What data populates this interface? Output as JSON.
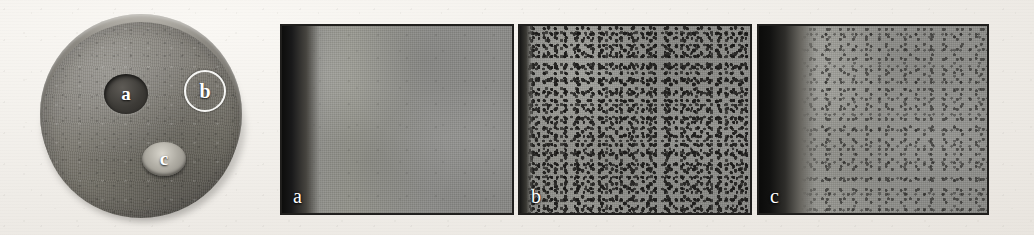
{
  "figure": {
    "background_color": "#efece7",
    "ghost_text": {
      "left": "",
      "right": "",
      "bottom": ""
    }
  },
  "specimen": {
    "name": "cylindrical-metal-specimen-disc",
    "body_color": "#807d76",
    "rim_color": "#8e8b84",
    "sites": [
      {
        "id": "a",
        "label": "a",
        "marker_type": "dark-recessed-spot",
        "color": "#3d3b37",
        "text_color": "#ffffff"
      },
      {
        "id": "b",
        "label": "b",
        "marker_type": "white-ring-annotation",
        "color": "#f6f6f4",
        "text_color": "#ffffff"
      },
      {
        "id": "c",
        "label": "c",
        "marker_type": "bright-raised-nub",
        "color": "#b0ada4",
        "text_color": "#ffffff"
      }
    ]
  },
  "panels": [
    {
      "id": "a",
      "label": "a",
      "description": "uniform fine-grained gray matrix, dark band at left edge",
      "matrix_color": "#939390",
      "edge_color": "#0d0d0c",
      "porosity": "none",
      "label_color": "#ffffff",
      "border_color": "#201f1d"
    },
    {
      "id": "b",
      "label": "b",
      "description": "dense dark porosity speckle across full field, thin dark left edge",
      "matrix_color": "#949490",
      "edge_color": "#171716",
      "porosity": "heavy",
      "label_color": "#ffffff",
      "border_color": "#201f1d"
    },
    {
      "id": "c",
      "label": "c",
      "description": "moderate porosity speckle, broad dark gradient band at left edge",
      "matrix_color": "#959591",
      "edge_color": "#0b0b0a",
      "porosity": "moderate",
      "label_color": "#ffffff",
      "border_color": "#201f1d"
    }
  ]
}
